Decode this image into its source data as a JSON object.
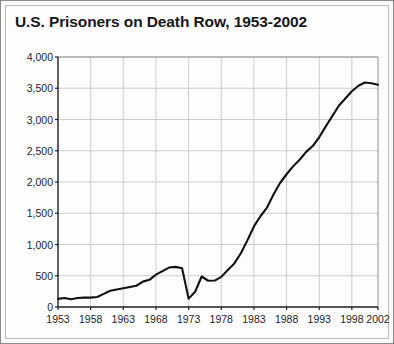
{
  "chart_data": {
    "type": "line",
    "title": "U.S. Prisoners on Death Row, 1953-2002",
    "xlabel": "",
    "ylabel": "",
    "xlim": [
      1953,
      2002
    ],
    "ylim": [
      0,
      4000
    ],
    "grid": true,
    "legend": "none",
    "y_ticks": [
      "0",
      "500",
      "1,000",
      "1,500",
      "2,000",
      "2,500",
      "3,000",
      "3,500",
      "4,000"
    ],
    "y_tick_values": [
      0,
      500,
      1000,
      1500,
      2000,
      2500,
      3000,
      3500,
      4000
    ],
    "x_ticks": [
      "1953",
      "1958",
      "1963",
      "1968",
      "1973",
      "1978",
      "1983",
      "1988",
      "1993",
      "1998",
      "2002"
    ],
    "x_tick_values": [
      1953,
      1958,
      1963,
      1968,
      1973,
      1978,
      1983,
      1988,
      1993,
      1998,
      2002
    ],
    "series": [
      {
        "name": "U.S. Prisoners on Death Row",
        "color": "#111111",
        "x": [
          1953,
          1954,
          1955,
          1956,
          1957,
          1958,
          1959,
          1960,
          1961,
          1962,
          1963,
          1964,
          1965,
          1966,
          1967,
          1968,
          1969,
          1970,
          1971,
          1972,
          1973,
          1974,
          1975,
          1976,
          1977,
          1978,
          1979,
          1980,
          1981,
          1982,
          1983,
          1984,
          1985,
          1986,
          1987,
          1988,
          1989,
          1990,
          1991,
          1992,
          1993,
          1994,
          1995,
          1996,
          1997,
          1998,
          1999,
          2000,
          2001,
          2002
        ],
        "values": [
          130,
          145,
          125,
          145,
          150,
          150,
          160,
          210,
          260,
          280,
          300,
          320,
          340,
          406,
          435,
          517,
          575,
          631,
          642,
          620,
          134,
          244,
          488,
          420,
          423,
          482,
          593,
          697,
          860,
          1066,
          1289,
          1452,
          1591,
          1800,
          1984,
          2124,
          2250,
          2356,
          2482,
          2575,
          2716,
          2890,
          3054,
          3219,
          3335,
          3452,
          3540,
          3593,
          3581,
          3557
        ]
      }
    ]
  },
  "axes": {
    "plot_left": 57,
    "plot_top": 56,
    "plot_right": 377,
    "plot_bottom": 306
  }
}
